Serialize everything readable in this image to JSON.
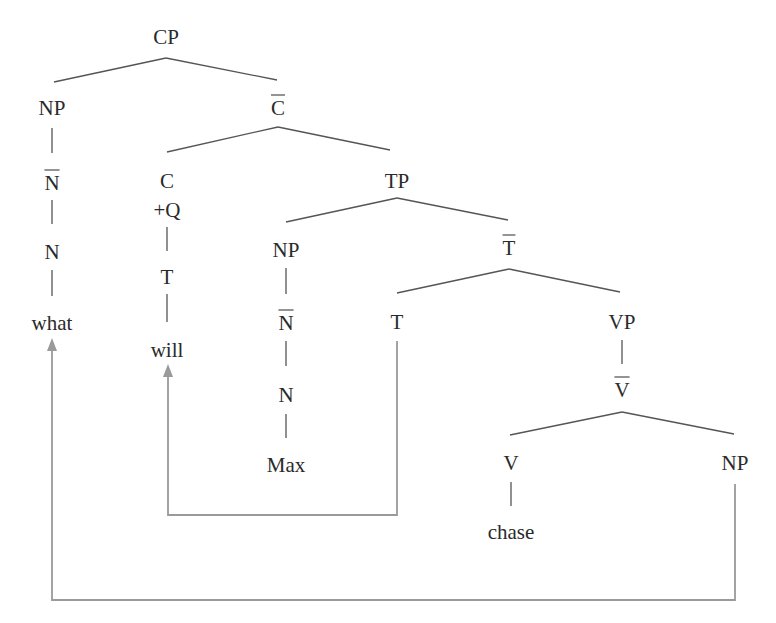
{
  "diagram": {
    "type": "syntax-tree",
    "colors": {
      "text": "#2a2a2a",
      "branch": "#555555",
      "movement_arrow": "#9a9a9a",
      "background": "#ffffff"
    },
    "nodes": {
      "cp": "CP",
      "np_spec_cp": "NP",
      "c_bar": "C",
      "n_bar_what": "N",
      "n_what": "N",
      "what": "what",
      "c": "C",
      "c_feature": "+Q",
      "t_in_c": "T",
      "will": "will",
      "tp": "TP",
      "np_subject": "NP",
      "n_bar_max": "N",
      "n_max": "N",
      "max": "Max",
      "t_bar": "T",
      "t_head": "T",
      "vp": "VP",
      "v_bar": "V",
      "v_head": "V",
      "chase": "chase",
      "np_object": "NP"
    },
    "bar_nodes": [
      "c_bar",
      "n_bar_what",
      "n_bar_max",
      "t_bar",
      "v_bar"
    ],
    "movements": [
      {
        "from": "t_head",
        "to": "will",
        "label": "T-to-C movement"
      },
      {
        "from": "np_object",
        "to": "what",
        "label": "wh-movement"
      }
    ]
  }
}
